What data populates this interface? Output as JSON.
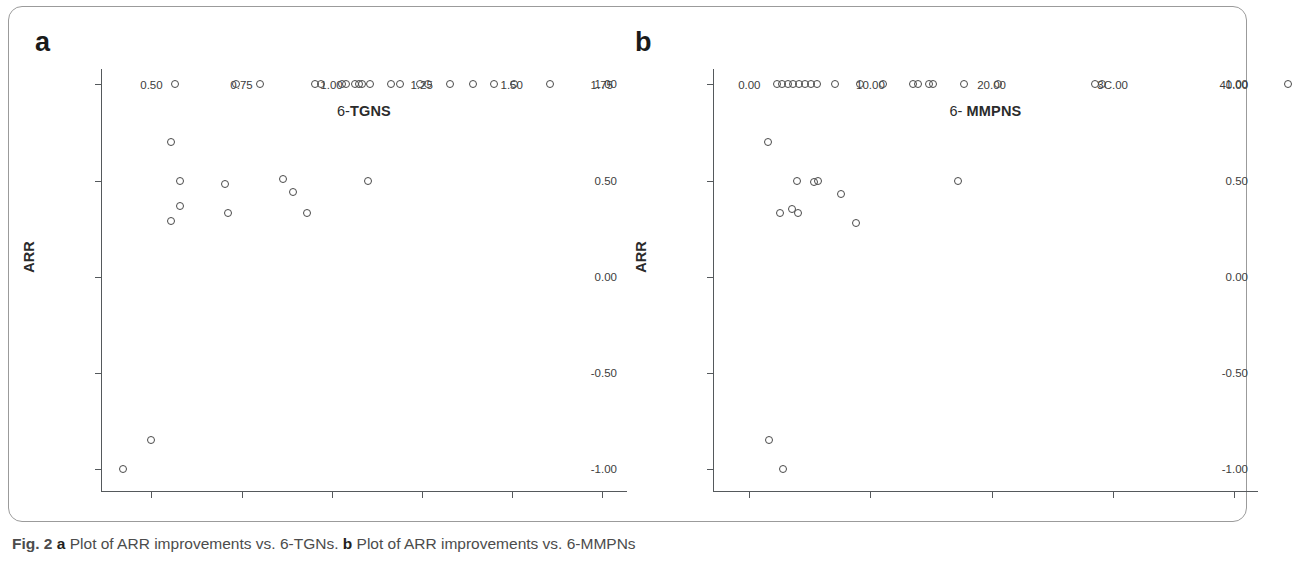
{
  "figure": {
    "caption_prefix": "Fig. 2",
    "caption_panel_a_letter": "a",
    "caption_panel_a_text": " Plot of ARR improvements vs. 6-TGNs. ",
    "caption_panel_b_letter": "b",
    "caption_panel_b_text": " Plot of ARR improvements vs. 6-MMPNs"
  },
  "panel_a": {
    "letter": "a",
    "axis_title_y": "ARR",
    "axis_title_x_prefix": "6-",
    "axis_title_x_tail": "TGNS"
  },
  "panel_b": {
    "letter": "b",
    "axis_title_y": "ARR",
    "axis_title_x_prefix": "6- ",
    "axis_title_x_tail": "MMPNS"
  },
  "chart_data": [
    {
      "type": "scatter",
      "panel": "a",
      "title": "Plot of ARR improvements vs. 6-TGNs",
      "xlabel": "6-TGNS",
      "ylabel": "ARR",
      "xlim": [
        0.36,
        1.82
      ],
      "ylim": [
        -1.12,
        1.08
      ],
      "xticks": [
        0.5,
        0.75,
        1.0,
        1.25,
        1.5,
        1.75
      ],
      "xticklabels": [
        "0.50",
        "0.75",
        "1.00",
        "1.25",
        "1.50",
        "1.75"
      ],
      "yticks": [
        1.0,
        0.5,
        0.0,
        -0.5,
        -1.0
      ],
      "yticklabels": [
        "1.00",
        "0.50",
        "0.00",
        "-0.50",
        "-1.00"
      ],
      "grid": false,
      "legend": false,
      "marker": "open-circle",
      "points": [
        {
          "x": 0.565,
          "y": 1.0
        },
        {
          "x": 0.735,
          "y": 1.0
        },
        {
          "x": 0.8,
          "y": 1.0
        },
        {
          "x": 0.955,
          "y": 1.0
        },
        {
          "x": 0.972,
          "y": 1.0
        },
        {
          "x": 1.03,
          "y": 1.0
        },
        {
          "x": 1.04,
          "y": 1.0
        },
        {
          "x": 1.065,
          "y": 1.0
        },
        {
          "x": 1.075,
          "y": 1.0
        },
        {
          "x": 1.085,
          "y": 1.0
        },
        {
          "x": 1.107,
          "y": 1.0
        },
        {
          "x": 1.165,
          "y": 1.0
        },
        {
          "x": 1.19,
          "y": 1.0
        },
        {
          "x": 1.245,
          "y": 1.0
        },
        {
          "x": 1.268,
          "y": 1.0
        },
        {
          "x": 1.33,
          "y": 1.0
        },
        {
          "x": 1.392,
          "y": 1.0
        },
        {
          "x": 1.45,
          "y": 1.0
        },
        {
          "x": 1.505,
          "y": 1.0
        },
        {
          "x": 1.605,
          "y": 1.0
        },
        {
          "x": 0.555,
          "y": 0.7
        },
        {
          "x": 0.578,
          "y": 0.5
        },
        {
          "x": 0.705,
          "y": 0.48
        },
        {
          "x": 0.866,
          "y": 0.51
        },
        {
          "x": 0.893,
          "y": 0.44
        },
        {
          "x": 1.1,
          "y": 0.5
        },
        {
          "x": 0.578,
          "y": 0.37
        },
        {
          "x": 0.555,
          "y": 0.29
        },
        {
          "x": 0.713,
          "y": 0.33
        },
        {
          "x": 0.932,
          "y": 0.33
        },
        {
          "x": 0.5,
          "y": -0.85
        },
        {
          "x": 0.422,
          "y": -1.0
        }
      ]
    },
    {
      "type": "scatter",
      "panel": "b",
      "title": "Plot of ARR improvements vs. 6-MMPNs",
      "xlabel": "6- MMPNS",
      "ylabel": "ARR",
      "xlim": [
        -3.0,
        42.0
      ],
      "ylim": [
        -1.12,
        1.08
      ],
      "xticks": [
        0,
        10,
        20,
        30,
        40
      ],
      "xticklabels": [
        "0.00",
        "10.00",
        "20.00",
        "3C.00",
        "40.00"
      ],
      "yticks": [
        1.0,
        0.5,
        0.0,
        -0.5,
        -1.0
      ],
      "yticklabels": [
        "1.00",
        "0.50",
        "0.00",
        "-0.50",
        "-1.00"
      ],
      "grid": false,
      "legend": false,
      "marker": "open-circle",
      "points": [
        {
          "x": 2.3,
          "y": 1.0
        },
        {
          "x": 2.7,
          "y": 1.0
        },
        {
          "x": 3.2,
          "y": 1.0
        },
        {
          "x": 3.6,
          "y": 1.0
        },
        {
          "x": 4.1,
          "y": 1.0
        },
        {
          "x": 4.6,
          "y": 1.0
        },
        {
          "x": 5.1,
          "y": 1.0
        },
        {
          "x": 5.6,
          "y": 1.0
        },
        {
          "x": 7.1,
          "y": 1.0
        },
        {
          "x": 9.1,
          "y": 1.0
        },
        {
          "x": 11.0,
          "y": 1.0
        },
        {
          "x": 13.5,
          "y": 1.0
        },
        {
          "x": 13.9,
          "y": 1.0
        },
        {
          "x": 14.8,
          "y": 1.0
        },
        {
          "x": 15.2,
          "y": 1.0
        },
        {
          "x": 17.7,
          "y": 1.0
        },
        {
          "x": 20.5,
          "y": 1.0
        },
        {
          "x": 28.5,
          "y": 1.0
        },
        {
          "x": 29.1,
          "y": 1.0
        },
        {
          "x": 44.5,
          "y": 1.0
        },
        {
          "x": 1.5,
          "y": 0.7
        },
        {
          "x": 3.9,
          "y": 0.5
        },
        {
          "x": 5.3,
          "y": 0.49
        },
        {
          "x": 5.7,
          "y": 0.5
        },
        {
          "x": 7.6,
          "y": 0.43
        },
        {
          "x": 17.2,
          "y": 0.5
        },
        {
          "x": 2.5,
          "y": 0.33
        },
        {
          "x": 3.5,
          "y": 0.35
        },
        {
          "x": 4.0,
          "y": 0.33
        },
        {
          "x": 8.8,
          "y": 0.28
        },
        {
          "x": 1.6,
          "y": -0.85
        },
        {
          "x": 2.8,
          "y": -1.0
        }
      ]
    }
  ]
}
